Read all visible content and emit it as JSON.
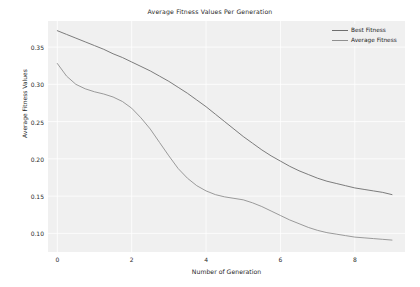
{
  "chart_data": {
    "type": "line",
    "title": "Average Fitness Values Per Generation",
    "xlabel": "Number of Generation",
    "ylabel": "Average Fitness Values",
    "xlim": [
      -0.25,
      9.35
    ],
    "ylim": [
      0.075,
      0.385
    ],
    "xticks": [
      "0",
      "2",
      "4",
      "6",
      "8"
    ],
    "xtick_values": [
      0,
      2,
      4,
      6,
      8
    ],
    "yticks": [
      "0.10",
      "0.15",
      "0.20",
      "0.25",
      "0.30",
      "0.35"
    ],
    "ytick_values": [
      0.1,
      0.15,
      0.2,
      0.25,
      0.3,
      0.35
    ],
    "grid": true,
    "grid_color": "#ffffff",
    "plot_background": "#f0f0f0",
    "figure_background": "#ffffff",
    "legend_position": "upper right",
    "x": [
      0,
      0.25,
      0.5,
      0.75,
      1,
      1.25,
      1.5,
      1.75,
      2,
      2.25,
      2.5,
      2.75,
      3,
      3.25,
      3.5,
      3.75,
      4,
      4.25,
      4.5,
      4.75,
      5,
      5.25,
      5.5,
      5.75,
      6,
      6.25,
      6.5,
      6.75,
      7,
      7.25,
      7.5,
      7.75,
      8,
      8.25,
      8.5,
      8.75,
      9
    ],
    "series": [
      {
        "name": "Best Fitness",
        "color": "#6e6e6e",
        "values": [
          0.372,
          0.367,
          0.362,
          0.357,
          0.352,
          0.347,
          0.341,
          0.336,
          0.33,
          0.324,
          0.318,
          0.311,
          0.304,
          0.296,
          0.288,
          0.279,
          0.27,
          0.26,
          0.25,
          0.24,
          0.23,
          0.221,
          0.212,
          0.204,
          0.197,
          0.19,
          0.184,
          0.179,
          0.174,
          0.17,
          0.167,
          0.164,
          0.161,
          0.159,
          0.157,
          0.155,
          0.152
        ]
      },
      {
        "name": "Average Fitness",
        "color": "#909090",
        "values": [
          0.328,
          0.311,
          0.3,
          0.294,
          0.29,
          0.287,
          0.283,
          0.277,
          0.268,
          0.255,
          0.24,
          0.222,
          0.204,
          0.187,
          0.174,
          0.164,
          0.157,
          0.152,
          0.149,
          0.147,
          0.145,
          0.141,
          0.136,
          0.13,
          0.124,
          0.118,
          0.113,
          0.108,
          0.104,
          0.101,
          0.099,
          0.097,
          0.095,
          0.094,
          0.093,
          0.092,
          0.091
        ]
      }
    ]
  }
}
